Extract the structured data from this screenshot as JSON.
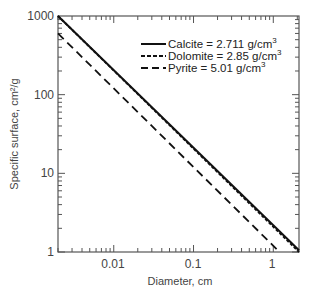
{
  "chart_data": {
    "type": "line",
    "title": "",
    "xlabel": "Diameter, cm",
    "ylabel": "Specific surface, cm²/g",
    "xscale": "log",
    "yscale": "log",
    "xlim": [
      0.002,
      2.1
    ],
    "ylim": [
      1,
      1000
    ],
    "x_ticks": [
      "0.01",
      "0.1",
      "1"
    ],
    "y_ticks": [
      "1",
      "10",
      "100",
      "1000"
    ],
    "grid": false,
    "legend_position": "upper right",
    "series": [
      {
        "name": "Calcite = 2.711 g/cm³",
        "label_main": "Calcite = 2.711 g/cm",
        "style": "solid",
        "x": [
          0.002,
          2.1
        ],
        "y": [
          1100,
          1.05
        ]
      },
      {
        "name": "Dolomite = 2.85 g/cm³",
        "label_main": "Dolomite = 2.85 g/cm",
        "style": "dotted",
        "x": [
          0.002,
          2.1
        ],
        "y": [
          1050,
          1.0
        ]
      },
      {
        "name": "Pyrite = 5.01 g/cm³",
        "label_main": "Pyrite = 5.01 g/cm",
        "style": "dashed",
        "x": [
          0.002,
          1.2
        ],
        "y": [
          600,
          1.0
        ]
      }
    ],
    "superscript": "3"
  }
}
